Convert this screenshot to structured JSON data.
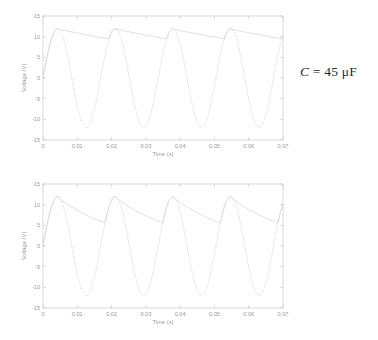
{
  "figure": {
    "background_color": "#ffffff",
    "line_color_solid": "#d2d2d2",
    "line_color_dashed": "#dcdcdc",
    "axis_color": "#c9c9c9",
    "tick_label_color": "#9a9a9a"
  },
  "panels": [
    {
      "id": "panel-45uF",
      "annotation": {
        "symbol": "C",
        "equals": "=",
        "value": "45",
        "unit": "μF",
        "full": "C = 45 μF"
      },
      "chart_data": {
        "type": "line",
        "title": "",
        "xlabel": "Time (s)",
        "ylabel": "Voltage (V)",
        "xlim": [
          0,
          0.07
        ],
        "ylim": [
          -15,
          15
        ],
        "xticks": [
          0,
          0.01,
          0.02,
          0.03,
          0.04,
          0.05,
          0.06,
          0.07
        ],
        "xticklabels": [
          "0",
          "0.01",
          "0.02",
          "0.03",
          "0.04",
          "0.05",
          "0.06",
          "0.07"
        ],
        "yticks": [
          -15,
          -10,
          -5,
          0,
          5,
          10,
          15
        ],
        "yticklabels": [
          "-15",
          "-10",
          "-5",
          "0",
          "5",
          "10",
          "15"
        ],
        "grid": false,
        "legend": "none",
        "series": [
          {
            "name": "input-sinusoid",
            "style": "dashed",
            "waveform": "sine",
            "amplitude": 12.0,
            "frequency_hz": 59.5,
            "phase_rad": 0.0,
            "offset": 0.0
          },
          {
            "name": "capacitor-output",
            "style": "solid",
            "waveform": "half-wave-rectified-rc-filtered",
            "peak_voltage": 11.85,
            "min_voltage": 9.45,
            "ripple_pp": 2.4,
            "rc_tau_s": 0.068,
            "frequency_hz": 59.5
          }
        ]
      }
    },
    {
      "id": "panel-10uF",
      "annotation": {
        "symbol": "C",
        "equals": "=",
        "value": "10",
        "unit": "μF",
        "full": "C = 10 μF"
      },
      "chart_data": {
        "type": "line",
        "title": "",
        "xlabel": "Time (s)",
        "ylabel": "Voltage (V)",
        "xlim": [
          0,
          0.07
        ],
        "ylim": [
          -15,
          15
        ],
        "xticks": [
          0,
          0.01,
          0.02,
          0.03,
          0.04,
          0.05,
          0.06,
          0.07
        ],
        "xticklabels": [
          "0",
          "0.01",
          "0.02",
          "0.03",
          "0.04",
          "0.05",
          "0.06",
          "0.07"
        ],
        "yticks": [
          -15,
          -10,
          -5,
          0,
          5,
          10,
          15
        ],
        "yticklabels": [
          "-15",
          "-10",
          "-5",
          "0",
          "5",
          "10",
          "15"
        ],
        "grid": false,
        "legend": "none",
        "series": [
          {
            "name": "input-sinusoid",
            "style": "dashed",
            "waveform": "sine",
            "amplitude": 12.0,
            "frequency_hz": 59.5,
            "phase_rad": 0.0,
            "offset": 0.0
          },
          {
            "name": "capacitor-output",
            "style": "solid",
            "waveform": "half-wave-rectified-rc-filtered",
            "peak_voltage": 11.85,
            "min_voltage": 5.1,
            "ripple_pp": 6.75,
            "rc_tau_s": 0.0185,
            "frequency_hz": 59.5
          }
        ]
      }
    }
  ]
}
